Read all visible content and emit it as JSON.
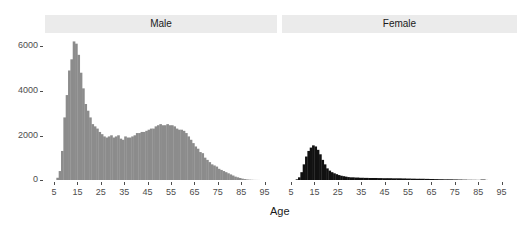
{
  "chart_data": {
    "type": "bar",
    "subtype": "histogram-faceted",
    "title": "",
    "xlabel": "Age",
    "ylabel": "",
    "xlim": [
      0,
      100
    ],
    "ylim": [
      0,
      6500
    ],
    "x_ticks": [
      5,
      15,
      25,
      35,
      45,
      55,
      65,
      75,
      85,
      95
    ],
    "y_ticks": [
      0,
      2000,
      4000,
      6000
    ],
    "y_tick_labels": [
      "0",
      "2000",
      "4000",
      "6000"
    ],
    "grid": false,
    "legend": null,
    "facets": [
      {
        "name": "Male",
        "color": "#8c8c8c",
        "x": [
          6,
          7,
          8,
          9,
          10,
          11,
          12,
          13,
          14,
          15,
          16,
          17,
          18,
          19,
          20,
          21,
          22,
          23,
          24,
          25,
          26,
          27,
          28,
          29,
          30,
          31,
          32,
          33,
          34,
          35,
          36,
          37,
          38,
          39,
          40,
          41,
          42,
          43,
          44,
          45,
          46,
          47,
          48,
          49,
          50,
          51,
          52,
          53,
          54,
          55,
          56,
          57,
          58,
          59,
          60,
          61,
          62,
          63,
          64,
          65,
          66,
          67,
          68,
          69,
          70,
          71,
          72,
          73,
          74,
          75,
          76,
          77,
          78,
          79,
          80,
          81,
          82,
          83,
          84,
          85,
          86,
          87,
          88,
          89,
          90,
          91,
          92
        ],
        "values": [
          100,
          400,
          1300,
          2800,
          3800,
          4900,
          5400,
          6200,
          6100,
          5600,
          4800,
          4100,
          3400,
          3100,
          2800,
          2500,
          2400,
          2300,
          2150,
          2050,
          1950,
          1900,
          1950,
          2000,
          1900,
          1950,
          2000,
          1850,
          1800,
          1950,
          1900,
          1900,
          1950,
          2000,
          2100,
          2100,
          2150,
          2150,
          2200,
          2250,
          2300,
          2300,
          2400,
          2450,
          2500,
          2450,
          2450,
          2500,
          2450,
          2450,
          2400,
          2300,
          2250,
          2250,
          2200,
          2100,
          1950,
          1800,
          1650,
          1500,
          1400,
          1250,
          1200,
          1000,
          900,
          800,
          700,
          650,
          600,
          500,
          450,
          400,
          350,
          300,
          250,
          200,
          150,
          120,
          90,
          60,
          40,
          25,
          15,
          10,
          5,
          3,
          2
        ]
      },
      {
        "name": "Female",
        "color": "#111111",
        "x": [
          7,
          8,
          9,
          10,
          11,
          12,
          13,
          14,
          15,
          16,
          17,
          18,
          19,
          20,
          21,
          22,
          23,
          24,
          25,
          26,
          27,
          28,
          29,
          30,
          32,
          34,
          36,
          38,
          40,
          42,
          44,
          46,
          48,
          50,
          52,
          54,
          56,
          58,
          60,
          62,
          64,
          66,
          68,
          70,
          72,
          74,
          76,
          78,
          80,
          82,
          84,
          86,
          88
        ],
        "values": [
          30,
          120,
          350,
          700,
          1050,
          1300,
          1450,
          1550,
          1500,
          1350,
          1150,
          900,
          700,
          520,
          420,
          350,
          300,
          260,
          220,
          190,
          170,
          150,
          130,
          120,
          110,
          100,
          95,
          90,
          90,
          85,
          80,
          80,
          75,
          75,
          70,
          65,
          60,
          55,
          55,
          50,
          45,
          40,
          35,
          30,
          30,
          25,
          20,
          15,
          10,
          8,
          5,
          20,
          3
        ]
      }
    ]
  },
  "facets": {
    "male": {
      "label": "Male"
    },
    "female": {
      "label": "Female"
    }
  },
  "axes": {
    "x_title": "Age",
    "x_tick_labels": [
      "5",
      "15",
      "25",
      "35",
      "45",
      "55",
      "65",
      "75",
      "85",
      "95"
    ],
    "y_tick_labels": [
      "6000",
      "4000",
      "2000",
      "0"
    ]
  }
}
